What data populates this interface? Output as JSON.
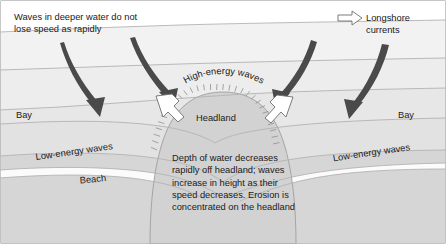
{
  "figure": {
    "type": "coastal-geography-diagram",
    "width": 446,
    "height": 244
  },
  "colors": {
    "page_background": "#ffffff",
    "border": "#9a9a9a",
    "land": "#d6d6d6",
    "sea_band_1": "#f2f2f2",
    "sea_band_2": "#ededed",
    "sea_band_3": "#e7e7e7",
    "sea_band_4": "#e2e2e2",
    "headland_fill": "#d2d2d2",
    "beach_fill": "#fbfbfb",
    "wave_line": "#b3b3b3",
    "wave_arrow": "#4a4a4a",
    "longshore_arrow_fill": "#ffffff",
    "longshore_arrow_stroke": "#6e6e6e",
    "text": "#1a1a1a"
  },
  "captions": {
    "deep_water": "Waves in deeper water do not\nlose speed as rapidly",
    "center": "Depth of water decreases\nrapidly off headland; waves\nincrease in height as their\nspeed decreases. Erosion is\nconcentrated on the headland"
  },
  "legend": {
    "label": "Longshore\ncurrents",
    "arrow_icon": "right-arrow-outline-icon"
  },
  "labels": {
    "bay_left": "Bay",
    "bay_right": "Bay",
    "headland": "Headland",
    "high_energy": "High-energy waves",
    "low_energy_left": "Low-energy waves",
    "low_energy_right": "Low-energy waves",
    "beach": "Beach"
  },
  "features": {
    "wave_crest_lines": 5,
    "wave_direction_arrows": 4,
    "longshore_current_arrows": 2,
    "cliff_hatch_marks": 30
  }
}
